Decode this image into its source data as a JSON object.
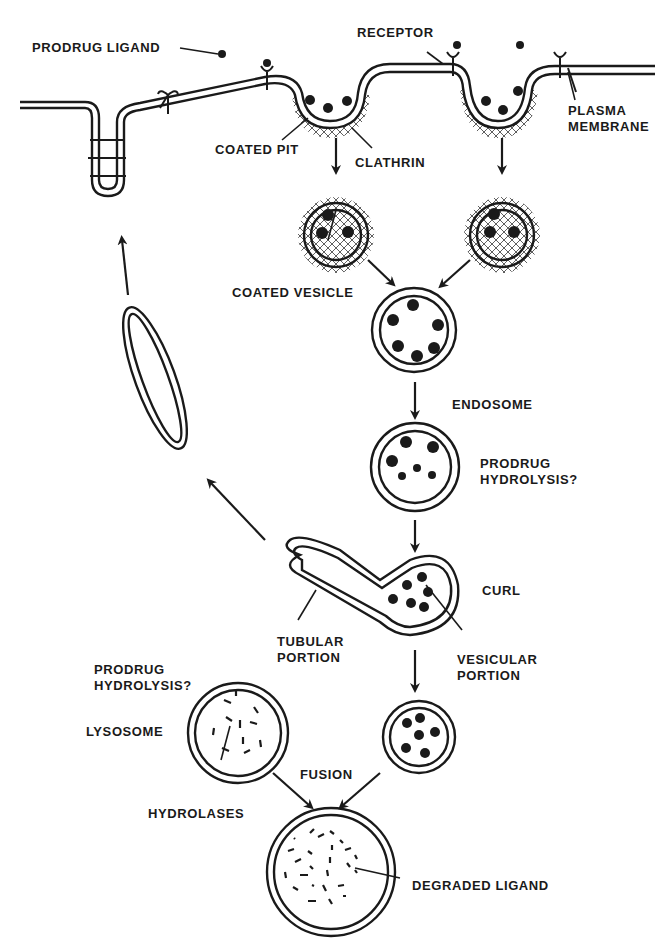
{
  "colors": {
    "ink": "#1a1a1a",
    "background": "#ffffff"
  },
  "labels": {
    "prodrug_ligand": "PRODRUG LIGAND",
    "receptor": "RECEPTOR",
    "plasma_membrane_1": "PLASMA",
    "plasma_membrane_2": "MEMBRANE",
    "coated_pit": "COATED PIT",
    "clathrin": "CLATHRIN",
    "coated_vesicle": "COATED VESICLE",
    "endosome": "ENDOSOME",
    "prodrug_hydrolysis_endosome_1": "PRODRUG",
    "prodrug_hydrolysis_endosome_2": "HYDROLYSIS?",
    "curl": "CURL",
    "tubular_portion_1": "TUBULAR",
    "tubular_portion_2": "PORTION",
    "vesicular_portion_1": "VESICULAR",
    "vesicular_portion_2": "PORTION",
    "prodrug_hydrolysis_lysosome_1": "PRODRUG",
    "prodrug_hydrolysis_lysosome_2": "HYDROLYSIS?",
    "lysosome": "LYSOSOME",
    "hydrolases": "HYDROLASES",
    "fusion": "FUSION",
    "degraded_ligand": "DEGRADED LIGAND"
  },
  "stages": [
    "Prodrug ligand binds receptor on plasma membrane",
    "Coated pit with clathrin forms",
    "Coated vesicles",
    "Uncoated vesicle fuses into endosome",
    "Endosome (prodrug hydrolysis?)",
    "CURL: tubular and vesicular portions",
    "Receptor recycling back to membrane",
    "Vesicle fuses with lysosome (hydrolases)",
    "Degraded ligand"
  ]
}
